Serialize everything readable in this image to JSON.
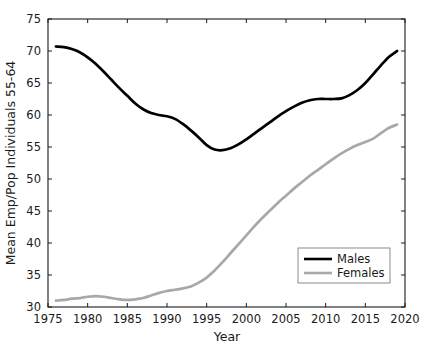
{
  "chart_data": {
    "type": "line",
    "title": "",
    "xlabel": "Year",
    "ylabel": "Mean Emp/Pop Individuals 55-64",
    "xlim": [
      1975,
      2020
    ],
    "ylim": [
      30,
      75
    ],
    "xticks": [
      1975,
      1980,
      1985,
      1990,
      1995,
      2000,
      2005,
      2010,
      2015,
      2020
    ],
    "yticks": [
      30,
      35,
      40,
      45,
      50,
      55,
      60,
      65,
      70,
      75
    ],
    "xtick_labels": [
      "1975",
      "1980",
      "1985",
      "1990",
      "1995",
      "2000",
      "2005",
      "2010",
      "2015",
      "2020"
    ],
    "ytick_labels": [
      "30",
      "35",
      "40",
      "45",
      "50",
      "55",
      "60",
      "65",
      "70",
      "75"
    ],
    "grid": false,
    "legend_position": "lower right",
    "colors": {
      "males": "#000000",
      "females": "#a8a8a8",
      "axis": "#1a1a1a",
      "background": "#ffffff"
    },
    "series": [
      {
        "name": "Males",
        "color": "#000000",
        "x": [
          1976,
          1977,
          1978,
          1979,
          1980,
          1981,
          1982,
          1983,
          1984,
          1985,
          1986,
          1987,
          1988,
          1989,
          1990,
          1991,
          1992,
          1993,
          1994,
          1995,
          1996,
          1997,
          1998,
          1999,
          2000,
          2001,
          2002,
          2003,
          2004,
          2005,
          2006,
          2007,
          2008,
          2009,
          2010,
          2011,
          2012,
          2013,
          2014,
          2015,
          2016,
          2017,
          2018,
          2019
        ],
        "values": [
          70.7,
          70.6,
          70.3,
          69.8,
          69.0,
          68.0,
          66.8,
          65.5,
          64.2,
          63.0,
          61.8,
          60.9,
          60.3,
          60.0,
          59.8,
          59.4,
          58.6,
          57.6,
          56.5,
          55.3,
          54.6,
          54.5,
          54.8,
          55.4,
          56.2,
          57.1,
          58.0,
          58.9,
          59.8,
          60.6,
          61.3,
          61.9,
          62.3,
          62.5,
          62.5,
          62.5,
          62.6,
          63.1,
          63.9,
          65.0,
          66.4,
          67.8,
          69.1,
          70.0
        ]
      },
      {
        "name": "Females",
        "color": "#a8a8a8",
        "x": [
          1976,
          1977,
          1978,
          1979,
          1980,
          1981,
          1982,
          1983,
          1984,
          1985,
          1986,
          1987,
          1988,
          1989,
          1990,
          1991,
          1992,
          1993,
          1994,
          1995,
          1996,
          1997,
          1998,
          1999,
          2000,
          2001,
          2002,
          2003,
          2004,
          2005,
          2006,
          2007,
          2008,
          2009,
          2010,
          2011,
          2012,
          2013,
          2014,
          2015,
          2016,
          2017,
          2018,
          2019
        ],
        "values": [
          31.0,
          31.1,
          31.3,
          31.4,
          31.6,
          31.7,
          31.6,
          31.4,
          31.2,
          31.1,
          31.2,
          31.4,
          31.8,
          32.2,
          32.5,
          32.7,
          32.9,
          33.2,
          33.8,
          34.6,
          35.7,
          37.0,
          38.4,
          39.8,
          41.2,
          42.6,
          43.9,
          45.1,
          46.3,
          47.4,
          48.5,
          49.5,
          50.5,
          51.4,
          52.3,
          53.2,
          54.0,
          54.7,
          55.3,
          55.8,
          56.3,
          57.2,
          58.0,
          58.5
        ]
      }
    ]
  },
  "legend": {
    "entries": [
      {
        "label": "Males"
      },
      {
        "label": "Females"
      }
    ]
  }
}
